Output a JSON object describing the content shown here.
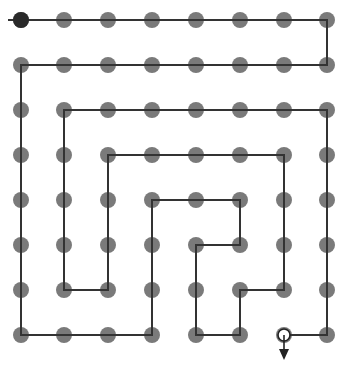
{
  "diagram": {
    "type": "grid-path",
    "grid": {
      "columns_x": [
        21,
        64,
        108,
        152,
        196,
        240,
        284,
        327
      ],
      "rows_y": [
        20,
        65,
        110,
        155,
        200,
        245,
        290,
        335
      ],
      "dot_radius": 8,
      "dot_color": "#7a7a7a"
    },
    "start": {
      "col": 0,
      "row": 0,
      "color": "#2a2a2a",
      "lead_in_x": 8
    },
    "end": {
      "col": 6,
      "row": 7,
      "marker": "open-circle-with-down-arrow"
    },
    "path_color": "#333333",
    "path": [
      [
        0,
        0
      ],
      [
        7,
        0
      ],
      [
        7,
        1
      ],
      [
        0,
        1
      ],
      [
        0,
        7
      ],
      [
        3,
        7
      ],
      [
        3,
        4
      ],
      [
        5,
        4
      ],
      [
        5,
        5
      ],
      [
        4,
        5
      ],
      [
        4,
        7
      ],
      [
        5,
        7
      ],
      [
        5,
        6
      ],
      [
        6,
        6
      ],
      [
        6,
        3
      ],
      [
        2,
        3
      ],
      [
        2,
        6
      ],
      [
        1,
        6
      ],
      [
        1,
        2
      ],
      [
        7,
        2
      ],
      [
        7,
        7
      ],
      [
        6,
        7
      ]
    ]
  }
}
